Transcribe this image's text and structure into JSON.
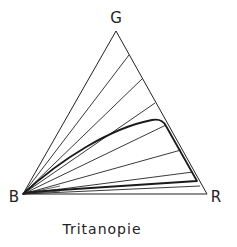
{
  "diagram": {
    "title": "Tritanopie",
    "vertices": {
      "G": {
        "label": "G",
        "x": 116,
        "y": 31
      },
      "B": {
        "label": "B",
        "x": 23,
        "y": 194
      },
      "R": {
        "label": "R",
        "x": 207,
        "y": 194
      }
    },
    "labels": {
      "g": "G",
      "b": "B",
      "r": "R"
    },
    "confusion_lines_endpoints": [
      {
        "x": 129,
        "y": 55
      },
      {
        "x": 143,
        "y": 78
      },
      {
        "x": 155,
        "y": 103
      },
      {
        "x": 166,
        "y": 125
      },
      {
        "x": 181,
        "y": 150
      },
      {
        "x": 193,
        "y": 172
      }
    ],
    "colors": {
      "line": "#222222",
      "background": "#ffffff"
    }
  }
}
